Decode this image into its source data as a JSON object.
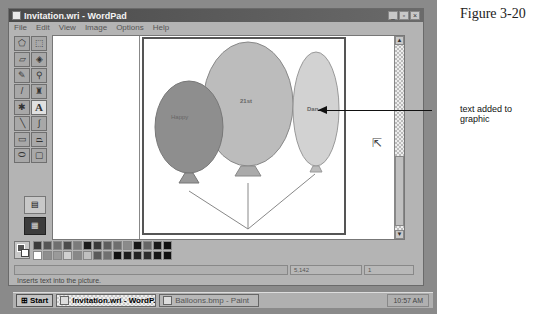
{
  "window": {
    "title": "Invitation.wri - WordPad",
    "buttons": {
      "minimize": "_",
      "maximize": "▫",
      "close": "×"
    }
  },
  "menu": [
    {
      "label": "File"
    },
    {
      "label": "Edit"
    },
    {
      "label": "View"
    },
    {
      "label": "Image"
    },
    {
      "label": "Options"
    },
    {
      "label": "Help"
    }
  ],
  "toolbox": {
    "tools": [
      {
        "name": "free-form-select",
        "glyph": "⬠"
      },
      {
        "name": "select",
        "glyph": "⬚"
      },
      {
        "name": "eraser",
        "glyph": "▱"
      },
      {
        "name": "fill",
        "glyph": "◈"
      },
      {
        "name": "pick-color",
        "glyph": "✎"
      },
      {
        "name": "magnifier",
        "glyph": "⚲"
      },
      {
        "name": "pencil",
        "glyph": "/"
      },
      {
        "name": "brush",
        "glyph": "♜"
      },
      {
        "name": "airbrush",
        "glyph": "✱"
      },
      {
        "name": "text",
        "glyph": "A"
      },
      {
        "name": "line",
        "glyph": "╲"
      },
      {
        "name": "curve",
        "glyph": "∫"
      },
      {
        "name": "rectangle",
        "glyph": "▭"
      },
      {
        "name": "polygon",
        "glyph": "⏢"
      },
      {
        "name": "ellipse",
        "glyph": "⬭"
      },
      {
        "name": "rounded-rectangle",
        "glyph": "▢"
      }
    ],
    "active_tool": "text",
    "option_1": "▤",
    "option_2": "▦"
  },
  "canvas": {
    "balloons": [
      {
        "label": "Happy",
        "color": "#8e8e8e"
      },
      {
        "label": "21st",
        "color": "#bcbcbc"
      },
      {
        "label": "Dan",
        "color": "#d2d2d2"
      }
    ]
  },
  "palette": {
    "colors": [
      "#3a3a3a",
      "#555555",
      "#6f6f6f",
      "#4c4c4c",
      "#7b7b7b",
      "#1a1a1a",
      "#3a3a3a",
      "#5e5e5e",
      "#6e6e6e",
      "#8a8a8a",
      "#151515",
      "#666666",
      "#1a1a1a",
      "#111111",
      "#ffffff",
      "#8e8e8e",
      "#9a9a9a",
      "#d0d0d0",
      "#888888",
      "#c0c0c0",
      "#5a5a5a",
      "#707070",
      "#111111",
      "#1e1e1e",
      "#222222",
      "#2c2c2c",
      "#141414",
      "#101010"
    ]
  },
  "status": {
    "hint": "Inserts text into the picture.",
    "coords": "5,142",
    "size": "1"
  },
  "taskbar": {
    "start": "Start",
    "tasks": [
      {
        "label": "Invitation.wri - WordP...",
        "active": true
      },
      {
        "label": "Balloons.bmp - Paint",
        "active": false
      }
    ],
    "clock": "10:57 AM"
  },
  "annotations": {
    "figure": "Figure 3-20",
    "callout": "text added to graphic"
  }
}
